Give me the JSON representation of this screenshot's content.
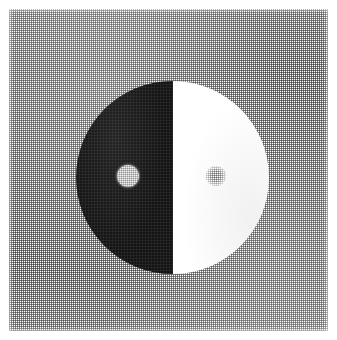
{
  "figure": {
    "title": "Taijitu (yin-yang) disc, halftone print",
    "caption": "",
    "medium": "halftone-screened grayscale scan",
    "canvas": {
      "width": 337,
      "height": 340,
      "page_color": "#ffffff",
      "margin_px": 9
    },
    "background": {
      "name": "halftone-gray-field",
      "label": "",
      "fill_color": "#9a9a9a",
      "pattern": "crosshatch-dot-screen",
      "screen_pitch_px": 2,
      "x": 9,
      "y": 9,
      "width": 319,
      "height": 322
    },
    "symbol": {
      "name": "yin-yang-disc",
      "label": "",
      "center_x": 172,
      "center_y": 177,
      "radius": 96,
      "halves": [
        {
          "name": "dark-half",
          "label": "",
          "side": "left",
          "color": "#141414"
        },
        {
          "name": "light-half",
          "label": "",
          "side": "right",
          "color": "#ffffff"
        }
      ],
      "divider": {
        "name": "vertical-divider",
        "label": "",
        "orientation": "vertical",
        "x": 172
      },
      "eyes": [
        {
          "name": "light-eye",
          "label": "",
          "on_half": "dark-half",
          "center_x": 128,
          "center_y": 176,
          "radius": 11,
          "color": "#f2f2f2"
        },
        {
          "name": "gray-eye",
          "label": "",
          "on_half": "light-half",
          "center_x": 216,
          "center_y": 176,
          "radius": 10,
          "color": "#b0b0b0"
        }
      ]
    }
  }
}
